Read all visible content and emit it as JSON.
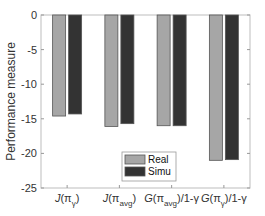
{
  "chart_data": {
    "type": "bar",
    "title": "",
    "xlabel": "",
    "ylabel": "Performance measure",
    "ylim": [
      -25,
      0
    ],
    "yticks": [
      0,
      -5,
      -10,
      -15,
      -20,
      -25
    ],
    "grid": false,
    "legend_position": "lower center (inside axes)",
    "categories": [
      "J(π_γ)",
      "J(π_avg)",
      "G(π_avg)/1-γ",
      "G(π_γ)/1-γ"
    ],
    "series": [
      {
        "name": "Real",
        "color": "#a6a6a6",
        "values": [
          -14.6,
          -16.1,
          -16.0,
          -21.0
        ]
      },
      {
        "name": "Simu",
        "color": "#333333",
        "values": [
          -14.3,
          -15.7,
          -16.0,
          -20.9
        ]
      }
    ]
  },
  "labels": {
    "ylabel": "Performance measure",
    "yticks": [
      "0",
      "-5",
      "-10",
      "-15",
      "-20",
      "-25"
    ],
    "categories": [
      {
        "main": "J(π",
        "sub": "γ",
        "tail": ")"
      },
      {
        "main": "J(π",
        "sub": "avg",
        "tail": ")"
      },
      {
        "main": "G(π",
        "sub": "avg",
        "tail": ")/1-γ"
      },
      {
        "main": "G(π",
        "sub": "γ",
        "tail": ")/1-γ"
      }
    ],
    "legend": [
      "Real",
      "Simu"
    ]
  }
}
